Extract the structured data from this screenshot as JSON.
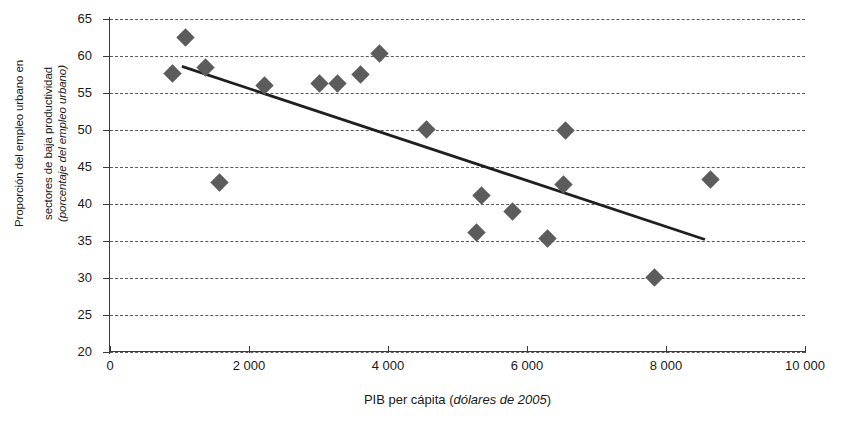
{
  "chart_data": {
    "type": "scatter",
    "title": "",
    "xlabel": "PIB per cápita (dólares de 2005)",
    "xlabel_plain": "PIB per cápita (",
    "xlabel_italic": "dólares de 2005",
    "xlabel_tail": ")",
    "ylabel_line1": "Proporción del empleo urbano en",
    "ylabel_line2": "sectores de baja productividad",
    "ylabel_line3": "(porcentaje del empleo urbano)",
    "xlim": [
      0,
      10000
    ],
    "ylim": [
      20,
      65
    ],
    "xticks": [
      0,
      2000,
      4000,
      6000,
      8000,
      10000
    ],
    "xtick_labels": [
      "0",
      "2 000",
      "4 000",
      "6 000",
      "8 000",
      "10 000"
    ],
    "yticks": [
      20,
      25,
      30,
      35,
      40,
      45,
      50,
      55,
      60,
      65
    ],
    "ytick_labels": [
      "20",
      "25",
      "30",
      "35",
      "40",
      "45",
      "50",
      "55",
      "60",
      "65"
    ],
    "grid": true,
    "grid_style": "dashed-horizontal",
    "legend": "none",
    "marker_shape": "diamond",
    "marker_color": "#5c5c5c",
    "trendline_color": "#1f1f1f",
    "points": [
      {
        "x": 905,
        "y": 57.6
      },
      {
        "x": 1080,
        "y": 62.5
      },
      {
        "x": 1370,
        "y": 58.5
      },
      {
        "x": 1580,
        "y": 42.9
      },
      {
        "x": 2230,
        "y": 56.0
      },
      {
        "x": 3020,
        "y": 56.3
      },
      {
        "x": 3280,
        "y": 56.3
      },
      {
        "x": 3600,
        "y": 57.5
      },
      {
        "x": 3880,
        "y": 60.4
      },
      {
        "x": 4560,
        "y": 50.1
      },
      {
        "x": 5280,
        "y": 36.1
      },
      {
        "x": 5340,
        "y": 41.1
      },
      {
        "x": 5790,
        "y": 39.0
      },
      {
        "x": 6290,
        "y": 35.4
      },
      {
        "x": 6520,
        "y": 42.6
      },
      {
        "x": 6560,
        "y": 50.0
      },
      {
        "x": 7830,
        "y": 30.1
      },
      {
        "x": 8640,
        "y": 43.3
      }
    ],
    "trendline": {
      "x1": 1035,
      "y1": 58.6,
      "x2": 8560,
      "y2": 35.2
    }
  }
}
